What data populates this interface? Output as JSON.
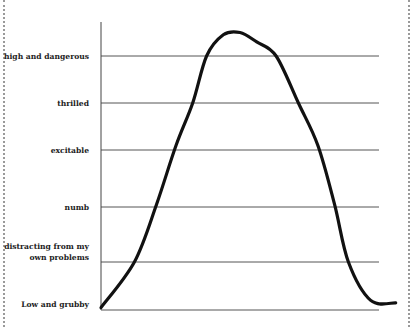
{
  "chart_data": {
    "type": "line",
    "title": "",
    "xlabel": "",
    "ylabel": "",
    "grid": true,
    "legend": "none",
    "ylim": [
      0,
      5.5
    ],
    "xlim": [
      0,
      100
    ],
    "y_tick_values": [
      0,
      1,
      2,
      3,
      4,
      5
    ],
    "y_tick_labels": [
      [
        "Low and grubby"
      ],
      [
        "distracting from my",
        "own problems"
      ],
      [
        "numb"
      ],
      [
        "excitable"
      ],
      [
        "thrilled"
      ],
      [
        "high and dangerous"
      ]
    ],
    "series": [
      {
        "name": "mood",
        "color": "#111111",
        "points": [
          [
            0,
            0.05
          ],
          [
            12,
            1.0
          ],
          [
            20,
            2.05
          ],
          [
            27,
            3.1
          ],
          [
            33,
            4.0
          ],
          [
            38,
            5.0
          ],
          [
            44,
            5.45
          ],
          [
            50,
            5.5
          ],
          [
            56,
            5.3
          ],
          [
            63,
            5.0
          ],
          [
            71,
            4.0
          ],
          [
            78,
            3.1
          ],
          [
            84,
            2.05
          ],
          [
            89,
            1.0
          ],
          [
            97,
            0.2
          ],
          [
            106,
            0.15
          ]
        ]
      }
    ]
  },
  "styles": {
    "grid_color": "#555555",
    "axis_color": "#444444",
    "line_color": "#111111"
  }
}
